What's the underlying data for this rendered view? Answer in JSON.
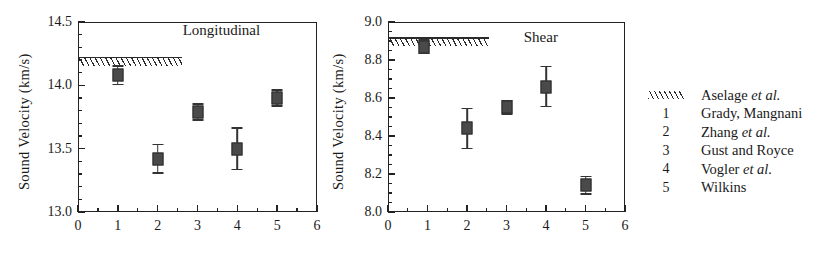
{
  "figure": {
    "caption_present": false
  },
  "chart_data": [
    {
      "type": "scatter",
      "title": "Longitudinal",
      "xlabel": "",
      "ylabel": "Sound Velocity  (km/s)",
      "xlim": [
        0,
        6
      ],
      "ylim": [
        13.0,
        14.5
      ],
      "xticks": [
        0,
        1,
        2,
        3,
        4,
        5,
        6
      ],
      "xtick_labels": [
        "0",
        "1",
        "2",
        "3",
        "4",
        "5",
        "6"
      ],
      "yticks": [
        13.0,
        13.5,
        14.0,
        14.5
      ],
      "ytick_labels": [
        "13.0",
        "13.5",
        "14.0",
        "14.5"
      ],
      "y_minor_step": 0.1,
      "x_minor_step": 0.5,
      "grid": false,
      "legend_position": "outside-right",
      "x": [
        1,
        2,
        3,
        4,
        5
      ],
      "values": [
        14.08,
        13.42,
        13.79,
        13.5,
        13.9
      ],
      "yerr": [
        0.08,
        0.12,
        0.07,
        0.17,
        0.07
      ],
      "point_labels": [
        "Grady, Mangnani",
        "Zhang et al.",
        "Gust and Royce",
        "Vogler et al.",
        "Wilkins"
      ],
      "band": {
        "label": "Aselage et al.",
        "y_center": 14.19,
        "x_start": 0,
        "x_end": 2.6,
        "style": "hatched"
      }
    },
    {
      "type": "scatter",
      "title": "Shear",
      "xlabel": "",
      "ylabel": "Sound Velocity  (km/s)",
      "xlim": [
        0,
        6
      ],
      "ylim": [
        8.0,
        9.0
      ],
      "xticks": [
        0,
        1,
        2,
        3,
        4,
        5,
        6
      ],
      "xtick_labels": [
        "0",
        "1",
        "2",
        "3",
        "4",
        "5",
        "6"
      ],
      "yticks": [
        8.0,
        8.2,
        8.4,
        8.6,
        8.8,
        9.0
      ],
      "ytick_labels": [
        "8.0",
        "8.2",
        "8.4",
        "8.6",
        "8.8",
        "9.0"
      ],
      "y_minor_step": 0.05,
      "x_minor_step": 0.5,
      "grid": false,
      "legend_position": "outside-right",
      "x": [
        0.92,
        2,
        3,
        4,
        5
      ],
      "values": [
        8.87,
        8.44,
        8.55,
        8.66,
        8.14
      ],
      "yerr": [
        0.04,
        0.11,
        0.04,
        0.11,
        0.05
      ],
      "point_labels": [
        "Grady, Mangnani",
        "Zhang et al.",
        "Gust and Royce",
        "Vogler et al.",
        "Wilkins"
      ],
      "band": {
        "label": "Aselage et al.",
        "y_center": 8.895,
        "x_start": 0,
        "x_end": 2.55,
        "style": "hatched"
      }
    }
  ],
  "legend": {
    "entries": [
      {
        "key": "hatch",
        "key_label": "",
        "text_plain": "Aselage et al.",
        "text_main": "Aselage ",
        "text_italic": "et al."
      },
      {
        "key": "number",
        "key_label": "1",
        "text_plain": "Grady, Mangnani",
        "text_main": "Grady, Mangnani",
        "text_italic": ""
      },
      {
        "key": "number",
        "key_label": "2",
        "text_plain": "Zhang et al.",
        "text_main": "Zhang ",
        "text_italic": "et al."
      },
      {
        "key": "number",
        "key_label": "3",
        "text_plain": "Gust and Royce",
        "text_main": "Gust and Royce",
        "text_italic": ""
      },
      {
        "key": "number",
        "key_label": "4",
        "text_plain": "Vogler et al.",
        "text_main": "Vogler ",
        "text_italic": "et al."
      },
      {
        "key": "number",
        "key_label": "5",
        "text_plain": "Wilkins",
        "text_main": "Wilkins",
        "text_italic": ""
      }
    ]
  },
  "colors": {
    "axis": "#222222",
    "marker_fill": "#4a4a4a",
    "marker_edge": "#2a2a2a",
    "hatch": "#2b2b2b",
    "background": "#ffffff",
    "text": "#1a1a1a"
  }
}
